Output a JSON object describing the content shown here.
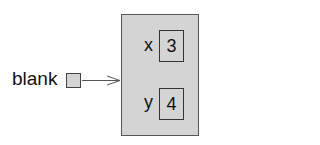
{
  "diagram": {
    "variable": {
      "name": "blank"
    },
    "object": {
      "attributes": [
        {
          "name": "x",
          "value": "3"
        },
        {
          "name": "y",
          "value": "4"
        }
      ]
    },
    "colors": {
      "fill": "#d4d4d4",
      "stroke": "#444444"
    }
  }
}
